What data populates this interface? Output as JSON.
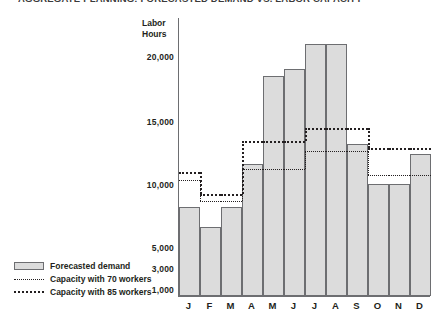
{
  "chart_title": "AGGREGATE PLANNING: FORECASTED DEMAND VS. LABOR CAPACITY",
  "axis_title_line1": "Labor",
  "axis_title_line2": "Hours",
  "legend": {
    "items": [
      {
        "label": "Forecasted demand",
        "marker": "bar-swatch",
        "color": "#dcdcdc"
      },
      {
        "label": "Capacity with 70 workers",
        "marker": "dotted-thin",
        "color": "#231f20"
      },
      {
        "label": "Capacity with 85 workers",
        "marker": "dotted-thick",
        "color": "#231f20"
      }
    ]
  },
  "chart_data": {
    "type": "bar",
    "title": "AGGREGATE PLANNING: FORECASTED DEMAND VS. LABOR CAPACITY",
    "xlabel": "",
    "ylabel": "Labor Hours",
    "grid": false,
    "legend_position": "bottom-left",
    "categories": [
      "J",
      "F",
      "M",
      "A",
      "M",
      "J",
      "J",
      "A",
      "S",
      "O",
      "N",
      "D"
    ],
    "category_names": [
      "January",
      "February",
      "March",
      "April",
      "May",
      "June",
      "July",
      "August",
      "September",
      "October",
      "November",
      "December"
    ],
    "ytick_labels": [
      "20,000",
      "15,000",
      "10,000",
      "5,000",
      "3,000",
      "1,000"
    ],
    "ytick_values": [
      20000,
      15000,
      10000,
      5000,
      3000,
      1000
    ],
    "ytick_pixel_y": [
      57,
      122,
      185,
      248,
      269,
      290
    ],
    "axis_baseline_pixel_y": 297,
    "ylim": [
      0,
      22500
    ],
    "series": [
      {
        "name": "Forecasted demand",
        "type": "bar",
        "values": [
          8800,
          6200,
          8800,
          13200,
          19300,
          20400,
          21600,
          21600,
          15200,
          10400,
          10400,
          12400
        ]
      },
      {
        "name": "Capacity with 70 workers",
        "type": "step",
        "values": [
          10900,
          8700,
          8700,
          12500,
          12500,
          12500,
          14000,
          14000,
          14000,
          11800,
          11800,
          11800
        ]
      },
      {
        "name": "Capacity with 85 workers",
        "type": "step",
        "values": [
          11800,
          9700,
          9700,
          15000,
          15000,
          15000,
          16300,
          16300,
          16300,
          14300,
          14300,
          14300
        ]
      }
    ]
  },
  "render": {
    "bar_top_px": [
      208,
      228,
      208,
      165,
      77,
      70,
      45,
      45,
      145,
      185,
      185,
      155
    ],
    "cap70_levels_px": [
      180,
      201,
      201,
      169,
      169,
      169,
      151,
      151,
      151,
      175,
      175,
      175
    ],
    "cap85_levels_px": [
      172,
      194,
      194,
      141,
      141,
      141,
      128,
      128,
      128,
      148,
      148,
      148
    ]
  }
}
